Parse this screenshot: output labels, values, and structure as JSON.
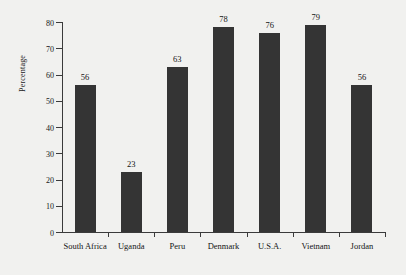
{
  "chart_data": {
    "type": "bar",
    "title": "",
    "xlabel": "",
    "ylabel": "Percentage",
    "categories": [
      "South Africa",
      "Uganda",
      "Peru",
      "Denmark",
      "U.S.A.",
      "Vietnam",
      "Jordan"
    ],
    "values": [
      56,
      23,
      63,
      78,
      76,
      79,
      56
    ],
    "value_labels": [
      "56",
      "23",
      "63",
      "78",
      "76",
      "79",
      "56"
    ],
    "ylim": [
      0,
      80
    ],
    "ytick_labels": [
      "0",
      "10",
      "20",
      "30",
      "40",
      "50",
      "60",
      "70",
      "80"
    ],
    "yticks": [
      0,
      10,
      20,
      30,
      40,
      50,
      60,
      70,
      80
    ],
    "grid": false,
    "legend": null,
    "bar_color": "#343434",
    "background_color": "#f1f1ef",
    "axis_color": "#3b3b3b"
  }
}
